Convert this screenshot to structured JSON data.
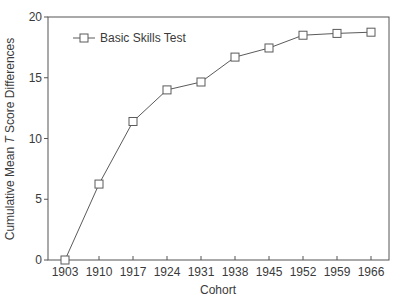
{
  "chart_data": {
    "type": "line",
    "title": "",
    "xlabel": "Cohort",
    "ylabel_prefix": "Cumulative Mean ",
    "ylabel_italic": "T",
    "ylabel_suffix": " Score Differences",
    "ylabel": "Cumulative Mean T Score Differences",
    "categories": [
      "1903",
      "1910",
      "1917",
      "1924",
      "1931",
      "1938",
      "1945",
      "1952",
      "1959",
      "1966"
    ],
    "series": [
      {
        "name": "Basic Skills Test",
        "marker": "open-square",
        "values": [
          0,
          6.25,
          11.4,
          14.0,
          14.65,
          16.7,
          17.45,
          18.5,
          18.65,
          18.75
        ]
      }
    ],
    "ylim": [
      0,
      20
    ],
    "yticks": [
      0,
      5,
      10,
      15,
      20
    ],
    "grid": false,
    "legend_position": "top-left inside"
  },
  "colors": {
    "line": "#5a5a5a",
    "axis": "#555555",
    "text": "#3a3a3a",
    "background": "#ffffff"
  }
}
